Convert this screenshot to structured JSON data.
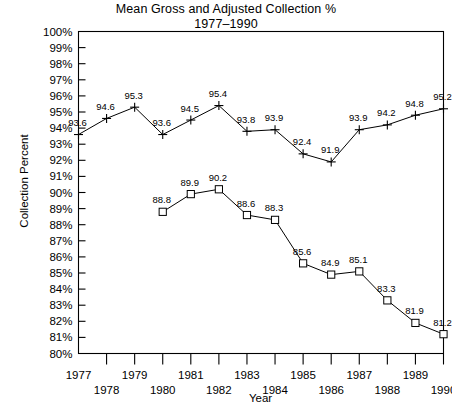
{
  "chart_data": {
    "type": "line",
    "title": "Mean Gross and Adjusted Collection %",
    "subtitle": "1977–1990",
    "xlabel": "Year",
    "ylabel": "Collection Percent",
    "grid": false,
    "legend": "none",
    "xlim": [
      1977,
      1990
    ],
    "ylim": [
      80,
      100
    ],
    "ytick_labels": [
      "100%",
      "99%",
      "98%",
      "97%",
      "96%",
      "95%",
      "94%",
      "93%",
      "92%",
      "91%",
      "90%",
      "89%",
      "88%",
      "87%",
      "86%",
      "85%",
      "84%",
      "83%",
      "82%",
      "81%",
      "80%"
    ],
    "ytick_values": [
      100,
      99,
      98,
      97,
      96,
      95,
      94,
      93,
      92,
      91,
      90,
      89,
      88,
      87,
      86,
      85,
      84,
      83,
      82,
      81,
      80
    ],
    "xtick_labels": [
      "1977",
      "1978",
      "1979",
      "1980",
      "1981",
      "1982",
      "1983",
      "1984",
      "1985",
      "1986",
      "1987",
      "1988",
      "1989",
      "1990"
    ],
    "categories": [
      1977,
      1978,
      1979,
      1980,
      1981,
      1982,
      1983,
      1984,
      1985,
      1986,
      1987,
      1988,
      1989,
      1990
    ],
    "series": [
      {
        "name": "Gross Collection %",
        "marker": "cross",
        "x": [
          1977,
          1978,
          1979,
          1980,
          1981,
          1982,
          1983,
          1984,
          1985,
          1986,
          1987,
          1988,
          1989,
          1990
        ],
        "values": [
          93.6,
          94.6,
          95.3,
          93.6,
          94.5,
          95.4,
          93.8,
          93.9,
          92.4,
          91.9,
          93.9,
          94.2,
          94.8,
          95.2
        ],
        "labels": [
          "93.6",
          "94.6",
          "95.3",
          "93.6",
          "94.5",
          "95.4",
          "93.8",
          "93.9",
          "92.4",
          "91.9",
          "93.9",
          "94.2",
          "94.8",
          "95.2"
        ]
      },
      {
        "name": "Adjusted Collection %",
        "marker": "square",
        "x": [
          1980,
          1981,
          1982,
          1983,
          1984,
          1985,
          1986,
          1987,
          1988,
          1989,
          1990
        ],
        "values": [
          88.8,
          89.9,
          90.2,
          88.6,
          88.3,
          85.6,
          84.9,
          85.1,
          83.3,
          81.9,
          81.2
        ],
        "labels": [
          "88.8",
          "89.9",
          "90.2",
          "88.6",
          "88.3",
          "85.6",
          "84.9",
          "85.1",
          "83.3",
          "81.9",
          "81.2"
        ]
      }
    ]
  }
}
